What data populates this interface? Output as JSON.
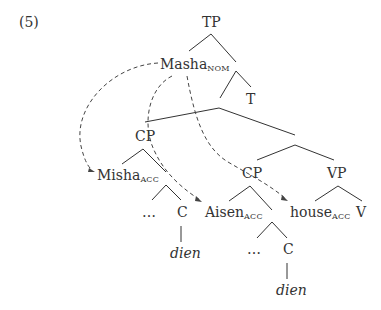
{
  "example_number": "(5)",
  "tree": {
    "root": "TP",
    "subject": {
      "base": "Masha",
      "sub": "NOM"
    },
    "t": "T",
    "cp1": {
      "label": "CP",
      "spec": {
        "base": "Misha",
        "sub": "ACC"
      },
      "dots": "…",
      "c": "C",
      "c_word": "dien"
    },
    "cp2": {
      "label": "CP",
      "spec": {
        "base": "Aisen",
        "sub": "ACC"
      },
      "dots": "…",
      "c": "C",
      "c_word": "dien"
    },
    "vp": {
      "label": "VP",
      "obj": {
        "base": "house",
        "sub": "ACC"
      },
      "v": "V"
    }
  },
  "colors": {
    "line": "#333333",
    "text": "#333333"
  }
}
